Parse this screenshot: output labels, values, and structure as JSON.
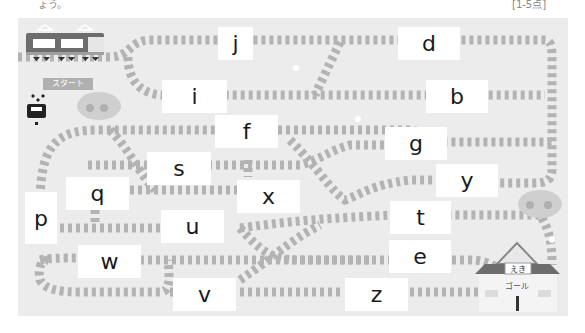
{
  "header": {
    "left_fragment": "ょう。",
    "right_fragment": "[1-5点]"
  },
  "start": {
    "label": "スタート"
  },
  "goal": {
    "station_sign": "えき",
    "label": "ゴール"
  },
  "letter_boxes": [
    {
      "id": "j",
      "letter": "j"
    },
    {
      "id": "d",
      "letter": "d"
    },
    {
      "id": "i",
      "letter": "i"
    },
    {
      "id": "b",
      "letter": "b"
    },
    {
      "id": "f",
      "letter": "f"
    },
    {
      "id": "g",
      "letter": "g"
    },
    {
      "id": "s",
      "letter": "s"
    },
    {
      "id": "y",
      "letter": "y"
    },
    {
      "id": "q",
      "letter": "q"
    },
    {
      "id": "x",
      "letter": "x"
    },
    {
      "id": "p",
      "letter": "p"
    },
    {
      "id": "u",
      "letter": "u"
    },
    {
      "id": "t",
      "letter": "t"
    },
    {
      "id": "w",
      "letter": "w"
    },
    {
      "id": "e",
      "letter": "e"
    },
    {
      "id": "v",
      "letter": "v"
    },
    {
      "id": "z",
      "letter": "z"
    }
  ],
  "colors": {
    "background": "#ececec",
    "track": "#b8b8b8",
    "tie": "#8f8f8f",
    "box": "#ffffff",
    "text": "#1a1a1a"
  }
}
